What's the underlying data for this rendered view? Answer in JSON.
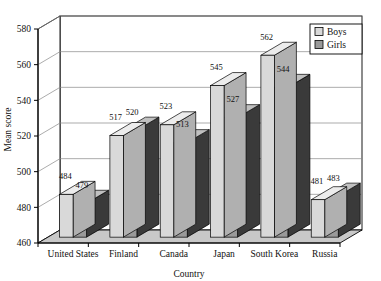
{
  "chart_data": {
    "type": "bar",
    "title": "",
    "subtitle": "",
    "xlabel": "Country",
    "ylabel": "Mean score",
    "categories": [
      "United States",
      "Finland",
      "Canada",
      "Japan",
      "South Korea",
      "Russia"
    ],
    "series": [
      {
        "name": "Boys",
        "color": "#d9d9d9",
        "values": [
          484,
          517,
          523,
          545,
          562,
          481
        ]
      },
      {
        "name": "Girls",
        "color": "#999999",
        "values": [
          479,
          520,
          513,
          527,
          544,
          483
        ]
      }
    ],
    "ylim": [
      460,
      580
    ],
    "yticks": [
      460,
      480,
      500,
      520,
      540,
      560,
      580
    ],
    "ytick_labels": [
      "460",
      "480",
      "500",
      "520",
      "540",
      "560",
      "580"
    ],
    "grid": true,
    "grid_axis": "y",
    "legend_position": "top-right",
    "legend_entries": [
      "Boys",
      "Girls"
    ],
    "data_labels": true,
    "style": "3d-column",
    "colors": {
      "boys_face": "#d9d9d9",
      "boys_top": "#ececec",
      "boys_side": "#b0b0b0",
      "girls_face": "#999999",
      "girls_top": "#c0c0c0",
      "girls_side": "#3a3a3a",
      "floor": "#c8c8c8",
      "wall": "#ffffff",
      "line": "#000000",
      "grid": "#888888"
    }
  }
}
